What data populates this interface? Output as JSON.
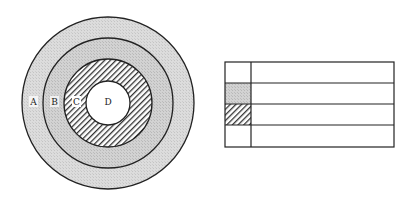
{
  "diagram": {
    "type": "concentric-rings-with-key-table",
    "rings": {
      "center": [
        108,
        103
      ],
      "layers": [
        {
          "label": "A",
          "radius": 86,
          "fill": "stipple-light",
          "color": "#d9d9d9"
        },
        {
          "label": "B",
          "radius": 65,
          "fill": "stipple",
          "color": "#d0d0d0"
        },
        {
          "label": "C",
          "radius": 44,
          "fill": "hatched",
          "color": "#555555"
        },
        {
          "label": "D",
          "radius": 22,
          "fill": "white",
          "color": "#ffffff"
        }
      ]
    },
    "labels": {
      "a": "A",
      "b": "B",
      "c": "C",
      "d": "D"
    },
    "table": {
      "rows": 4,
      "key_column_fills": [
        "white",
        "stipple",
        "hatched",
        "white"
      ],
      "cells": [
        {
          "key": "",
          "value": ""
        },
        {
          "key": "",
          "value": ""
        },
        {
          "key": "",
          "value": ""
        },
        {
          "key": "",
          "value": ""
        }
      ]
    }
  }
}
